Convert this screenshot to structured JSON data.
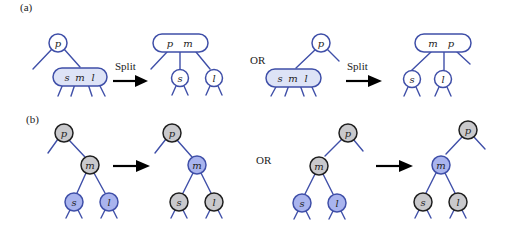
{
  "figure": {
    "panel_a": {
      "label": "(a)",
      "or_label": "OR",
      "split_label": "Split",
      "case1": {
        "before": {
          "parent": "p",
          "child_keys": [
            "s",
            "m",
            "l"
          ]
        },
        "after": {
          "parent_keys": [
            "p",
            "m"
          ],
          "children": [
            "s",
            "l"
          ]
        }
      },
      "case2": {
        "before": {
          "parent": "p",
          "child_keys": [
            "s",
            "m",
            "l"
          ]
        },
        "after": {
          "parent_keys": [
            "m",
            "p"
          ],
          "children": [
            "s",
            "l"
          ]
        }
      }
    },
    "panel_b": {
      "label": "(b)",
      "or_label": "OR",
      "case1": {
        "before": {
          "root": "p",
          "mid": "m",
          "left": "s",
          "right": "l"
        },
        "after": {
          "root": "p",
          "mid": "m",
          "left": "s",
          "right": "l"
        }
      },
      "case2": {
        "before": {
          "root": "p",
          "mid": "m",
          "left": "s",
          "right": "l"
        },
        "after": {
          "root": "p",
          "mid": "m",
          "left": "s",
          "right": "l"
        }
      }
    },
    "colors": {
      "edge": "#3f4fa8",
      "blue_fill": "#a9b4ee",
      "light_blue_fill": "#dde3f6",
      "gray_fill": "#c9c9cc"
    }
  }
}
